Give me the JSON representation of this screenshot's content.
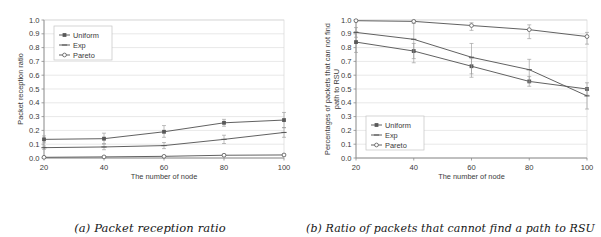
{
  "figure": {
    "panels": [
      {
        "id": "panel-a",
        "caption": "(a) Packet reception ratio"
      },
      {
        "id": "panel-b",
        "caption": "(b) Ratio of packets that cannot find a path to RSU"
      }
    ]
  },
  "chart_data": [
    {
      "type": "line",
      "id": "packet-reception-ratio",
      "title": "",
      "xlabel": "The number of node",
      "ylabel": "Packet reception ratio",
      "x": [
        20,
        40,
        60,
        80,
        100
      ],
      "xticklabels": [
        "20",
        "40",
        "60",
        "80",
        "100"
      ],
      "xlim": [
        20,
        100
      ],
      "ylim": [
        0.0,
        1.0
      ],
      "yticks": [
        0.0,
        0.1,
        0.2,
        0.3,
        0.4,
        0.5,
        0.6,
        0.7,
        0.8,
        0.9,
        1.0
      ],
      "yticklabels": [
        "0.0",
        "0.1",
        "0.2",
        "0.3",
        "0.4",
        "0.5",
        "0.6",
        "0.7",
        "0.8",
        "0.9",
        "1.0"
      ],
      "grid": true,
      "legend_position": "upper left",
      "series": [
        {
          "name": "Uniform",
          "marker": "filled-diamond",
          "values": [
            0.135,
            0.14,
            0.19,
            0.255,
            0.275
          ],
          "err_low": [
            0.025,
            0.035,
            0.04,
            0.025,
            0.055
          ],
          "err_high": [
            0.025,
            0.04,
            0.045,
            0.025,
            0.055
          ]
        },
        {
          "name": "Exp",
          "marker": "dash",
          "values": [
            0.075,
            0.08,
            0.09,
            0.135,
            0.185
          ],
          "err_low": [
            0.012,
            0.02,
            0.022,
            0.03,
            0.035
          ],
          "err_high": [
            0.012,
            0.02,
            0.022,
            0.03,
            0.035
          ]
        },
        {
          "name": "Pareto",
          "marker": "open-circle",
          "values": [
            0.005,
            0.008,
            0.012,
            0.02,
            0.022
          ],
          "err_low": [
            0.004,
            0.005,
            0.006,
            0.008,
            0.008
          ],
          "err_high": [
            0.004,
            0.005,
            0.006,
            0.008,
            0.008
          ]
        }
      ]
    },
    {
      "type": "line",
      "id": "no-path-to-rsu-ratio",
      "title": "",
      "xlabel": "The number of node",
      "ylabel": "Percentages of packets that can not find path to RSU",
      "ylabel_line1": "Percentages of packets that can not find",
      "ylabel_line2": "path to RSU",
      "x": [
        20,
        40,
        60,
        80,
        100
      ],
      "xticklabels": [
        "20",
        "40",
        "60",
        "80",
        "100"
      ],
      "xlim": [
        20,
        100
      ],
      "ylim": [
        0.0,
        1.0
      ],
      "yticks": [
        0.0,
        0.1,
        0.2,
        0.3,
        0.4,
        0.5,
        0.6,
        0.7,
        0.8,
        0.9,
        1.0
      ],
      "yticklabels": [
        "0.0",
        "0.1",
        "0.2",
        "0.3",
        "0.4",
        "0.5",
        "0.6",
        "0.7",
        "0.8",
        "0.9",
        "1.0"
      ],
      "grid": true,
      "legend_position": "lower left",
      "series": [
        {
          "name": "Uniform",
          "marker": "filled-diamond",
          "values": [
            0.84,
            0.775,
            0.665,
            0.555,
            0.5
          ],
          "err_low": [
            0.075,
            0.055,
            0.055,
            0.035,
            0.045
          ],
          "err_high": [
            0.075,
            0.055,
            0.055,
            0.035,
            0.045
          ]
        },
        {
          "name": "Exp",
          "marker": "dash",
          "values": [
            0.91,
            0.86,
            0.73,
            0.64,
            0.45
          ],
          "err_low": [
            0.035,
            0.17,
            0.145,
            0.09,
            0.095
          ],
          "err_high": [
            0.035,
            0.135,
            0.1,
            0.075,
            0.055
          ]
        },
        {
          "name": "Pareto",
          "marker": "open-circle",
          "values": [
            0.995,
            0.99,
            0.96,
            0.93,
            0.88
          ],
          "err_low": [
            0.008,
            0.015,
            0.035,
            0.065,
            0.055
          ],
          "err_high": [
            0.005,
            0.008,
            0.02,
            0.035,
            0.03
          ]
        }
      ]
    }
  ],
  "legend": {
    "items": [
      {
        "label": "Uniform"
      },
      {
        "label": "Exp"
      },
      {
        "label": "Pareto"
      }
    ]
  },
  "colors": {
    "line": "#595959",
    "grid": "#d8d8d8",
    "axis": "#8c8c8c",
    "text": "#3a3a3a",
    "caption": "#161616",
    "background": "#ffffff"
  }
}
